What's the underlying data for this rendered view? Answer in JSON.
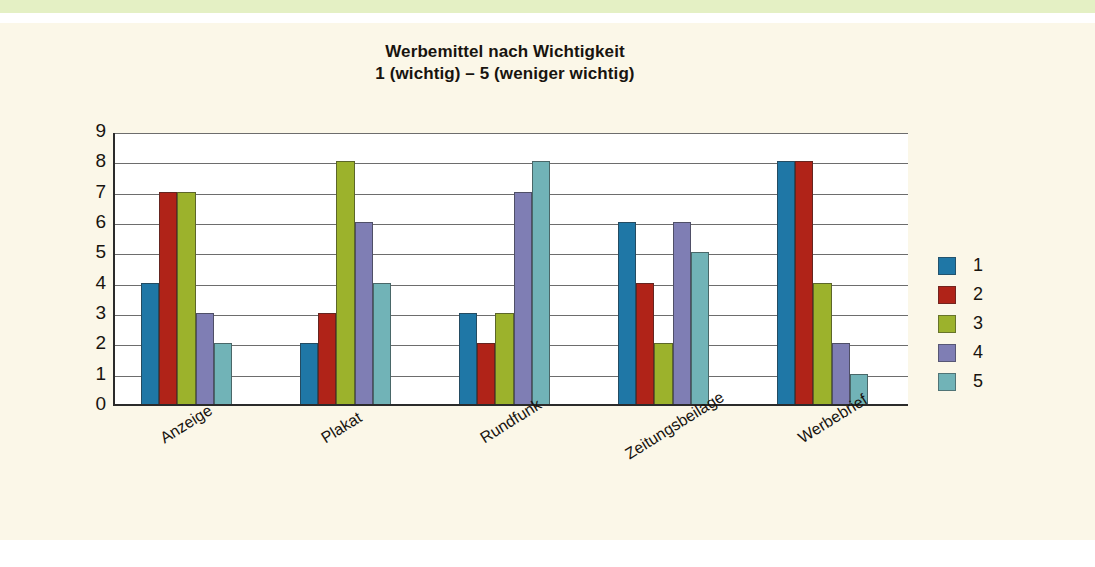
{
  "page": {
    "background_paper": "#fbf7e8",
    "top_band_color": "#e4f0c4"
  },
  "chart_data": {
    "type": "bar",
    "title": "Werbemittel nach Wichtigkeit",
    "subtitle": "1 (wichtig) – 5 (weniger wichtig)",
    "xlabel": "",
    "ylabel": "",
    "ylim": [
      0,
      9
    ],
    "yticks": [
      9,
      8,
      7,
      6,
      5,
      4,
      3,
      2,
      1,
      0
    ],
    "grid": true,
    "legend_position": "right",
    "categories": [
      "Anzeige",
      "Plakat",
      "Rundfunk",
      "Zeitungsbeilage",
      "Werbebrief"
    ],
    "series": [
      {
        "name": "1",
        "color": "#1f77a6",
        "values": [
          4,
          2,
          3,
          6,
          8
        ]
      },
      {
        "name": "2",
        "color": "#b02318",
        "values": [
          7,
          3,
          2,
          4,
          8
        ]
      },
      {
        "name": "3",
        "color": "#9cb22c",
        "values": [
          7,
          8,
          3,
          2,
          4
        ]
      },
      {
        "name": "4",
        "color": "#7f7eb4",
        "values": [
          3,
          6,
          7,
          6,
          2
        ]
      },
      {
        "name": "5",
        "color": "#71b3b7",
        "values": [
          2,
          4,
          8,
          5,
          1
        ]
      }
    ]
  },
  "legend": {
    "items": [
      {
        "label": "1",
        "color": "#1f77a6"
      },
      {
        "label": "2",
        "color": "#b02318"
      },
      {
        "label": "3",
        "color": "#9cb22c"
      },
      {
        "label": "4",
        "color": "#7f7eb4"
      },
      {
        "label": "5",
        "color": "#71b3b7"
      }
    ]
  }
}
